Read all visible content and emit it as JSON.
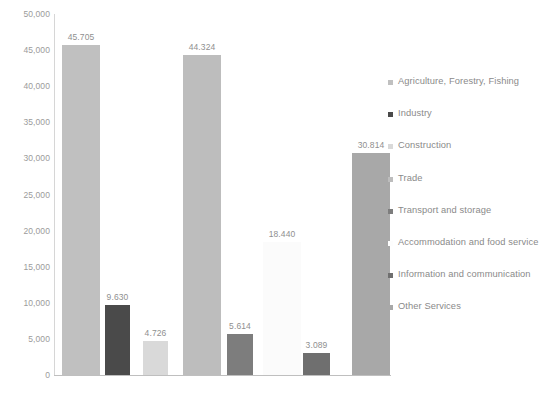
{
  "chart_data": {
    "type": "bar",
    "title": "",
    "subtitle": "",
    "xlabel": "",
    "ylabel": "",
    "ylim": [
      0,
      50000
    ],
    "grid": false,
    "legend_position": "right",
    "y_ticks": [
      "50,000",
      "45,000",
      "40,000",
      "35,000",
      "30,000",
      "25,000",
      "20,000",
      "15,000",
      "10,000",
      "5,000",
      "0"
    ],
    "y_tick_values": [
      50000,
      45000,
      40000,
      35000,
      30000,
      25000,
      20000,
      15000,
      10000,
      5000,
      0
    ],
    "categories": [
      "Agriculture, Forestry, Fishing",
      "Industry",
      "Construction",
      "Trade",
      "Transport and storage",
      "Accommodation and food service",
      "Information and communication",
      "Other Services"
    ],
    "values": [
      45705,
      9630,
      4726,
      44324,
      5614,
      18440,
      3089,
      30814
    ],
    "data_labels": [
      "45.705",
      "9.630",
      "4.726",
      "44.324",
      "5.614",
      "18.440",
      "3.089",
      "30.814"
    ],
    "colors": [
      "#c0c0c0",
      "#4a4a4a",
      "#d9d9d9",
      "#bdbdbd",
      "#7d7d7d",
      "#fbfbfb",
      "#6f6f6f",
      "#a8a8a8"
    ]
  },
  "legend": {
    "items": [
      {
        "label": "Agriculture, Forestry, Fishing",
        "color": "#c0c0c0"
      },
      {
        "label": "Industry",
        "color": "#4a4a4a"
      },
      {
        "label": "Construction",
        "color": "#d9d9d9"
      },
      {
        "label": "Trade",
        "color": "#bdbdbd"
      },
      {
        "label": "Transport and storage",
        "color": "#7d7d7d"
      },
      {
        "label": "Accommodation and food service",
        "color": "#fdfdfd"
      },
      {
        "label": "Information and communication",
        "color": "#6f6f6f"
      },
      {
        "label": "Other Services",
        "color": "#a8a8a8"
      }
    ]
  },
  "bar_geometry": [
    {
      "left": 7,
      "width": 38
    },
    {
      "left": 50,
      "width": 25
    },
    {
      "left": 88,
      "width": 25
    },
    {
      "left": 128,
      "width": 38
    },
    {
      "left": 172,
      "width": 26
    },
    {
      "left": 208,
      "width": 38
    },
    {
      "left": 248,
      "width": 27
    },
    {
      "left": 297,
      "width": 38
    }
  ]
}
